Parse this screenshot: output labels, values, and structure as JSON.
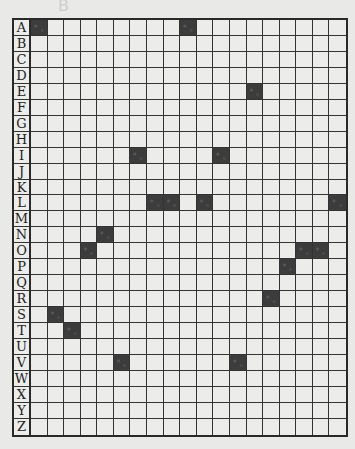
{
  "note": {
    "text": "B"
  },
  "grid": {
    "rows": [
      "A",
      "B",
      "C",
      "D",
      "E",
      "F",
      "G",
      "H",
      "I",
      "J",
      "K",
      "L",
      "M",
      "N",
      "O",
      "P",
      "Q",
      "R",
      "S",
      "T",
      "U",
      "V",
      "W",
      "X",
      "Y",
      "Z"
    ],
    "column_count": 19,
    "filled_color": "#3c3c3c",
    "empty_color": "#ececea",
    "filled": {
      "A": [
        1,
        10
      ],
      "E": [
        14
      ],
      "I": [
        7,
        12
      ],
      "L": [
        8,
        9,
        11,
        19
      ],
      "N": [
        5
      ],
      "O": [
        4,
        17,
        18
      ],
      "P": [
        16
      ],
      "R": [
        15
      ],
      "S": [
        2
      ],
      "T": [
        3
      ],
      "V": [
        6,
        13
      ]
    }
  }
}
